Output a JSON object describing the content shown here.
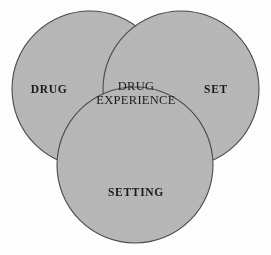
{
  "diagram": {
    "type": "venn-3-circle",
    "title": "",
    "colors": {
      "circle_fill": "#b8b8b8",
      "circle_stroke": "#4a4a4a",
      "text": "#1a1a1a",
      "background": "#ffffff"
    },
    "circles": [
      {
        "id": "drug",
        "label": "DRUG",
        "cx": 90,
        "cy": 89,
        "r": 78
      },
      {
        "id": "set",
        "label": "SET",
        "cx": 181,
        "cy": 89,
        "r": 78
      },
      {
        "id": "setting",
        "label": "SETTING",
        "cx": 135,
        "cy": 165,
        "r": 78
      }
    ],
    "labels": {
      "left": "DRUG",
      "right": "SET",
      "bottom": "SETTING",
      "center_line1": "DRUG",
      "center_line2": "EXPERIENCE"
    }
  }
}
